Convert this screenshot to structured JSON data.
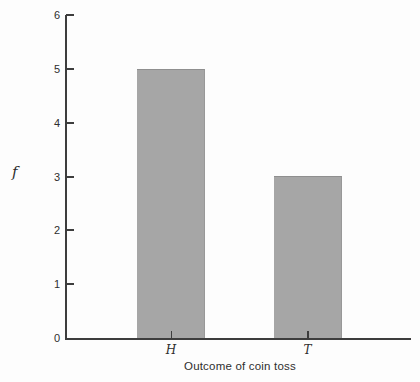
{
  "chart_data": {
    "type": "bar",
    "title": "",
    "categories": [
      "H",
      "T"
    ],
    "values": [
      5,
      3
    ],
    "xlabel": "Outcome of coin toss",
    "ylabel": "f",
    "ylim": [
      0,
      6
    ],
    "yticks": [
      0,
      1,
      2,
      3,
      4,
      5,
      6
    ],
    "grid": false,
    "legend": false,
    "bar_color": "#a6a6a6",
    "axis_color": "#3d3d3d",
    "text_color": "#2e2e2e",
    "background_color": "#fdfdfd"
  }
}
